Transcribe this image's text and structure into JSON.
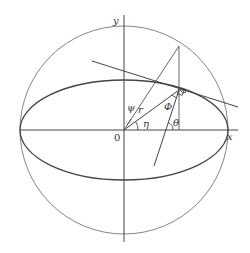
{
  "diagram": {
    "labels": {
      "y_axis": "y",
      "x_axis": "x",
      "origin": "0",
      "psi": "ψ",
      "r": "r",
      "eta": "η",
      "phi": "Φ",
      "theta": "θ"
    },
    "elements": [
      "auxiliary-circle",
      "ellipse",
      "x-axis",
      "y-axis",
      "tangent-line",
      "normal-line",
      "radius-to-ellipse-point",
      "radius-to-circle-point",
      "vertical-projection-line",
      "right-angle-marker"
    ]
  }
}
